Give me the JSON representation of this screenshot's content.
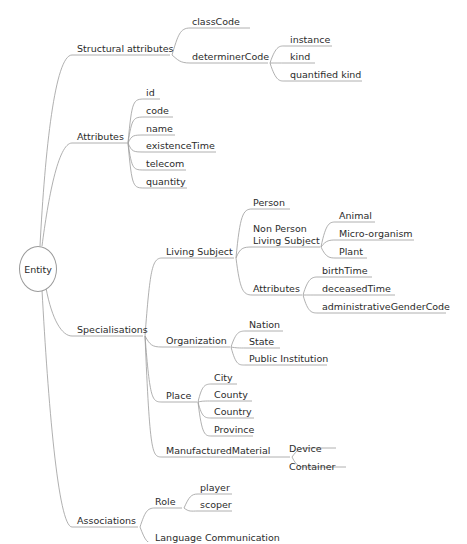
{
  "diagram": {
    "type": "mind-map",
    "root": "Entity",
    "nodes": {
      "structural": "Structural attributes",
      "classCode": "classCode",
      "determinerCode": "determinerCode",
      "instance": "instance",
      "kind": "kind",
      "quantifiedKind": "quantified kind",
      "attributes": "Attributes",
      "id": "id",
      "code": "code",
      "name": "name",
      "existenceTime": "existenceTime",
      "telecom": "telecom",
      "quantity": "quantity",
      "specialisations": "Specialisations",
      "livingSubject": "Living Subject",
      "person": "Person",
      "nonPerson1": "Non Person",
      "nonPerson2": "Living Subject",
      "animal": "Animal",
      "microorganism": "Micro-organism",
      "plant": "Plant",
      "lsAttributes": "Attributes",
      "birthTime": "birthTime",
      "deceasedTime": "deceasedTime",
      "adminGender": "administrativeGenderCode",
      "organization": "Organization",
      "nation": "Nation",
      "state": "State",
      "publicInstitution": "Public Institution",
      "place": "Place",
      "city": "City",
      "county": "County",
      "country": "Country",
      "province": "Province",
      "manufactured": "ManufacturedMaterial",
      "device": "Device",
      "container": "Container",
      "associations": "Associations",
      "role": "Role",
      "player": "player",
      "scoper": "scoper",
      "languageCommunication": "Language Communication"
    },
    "caption": "Fig. 10.3 The RIM Entity"
  }
}
